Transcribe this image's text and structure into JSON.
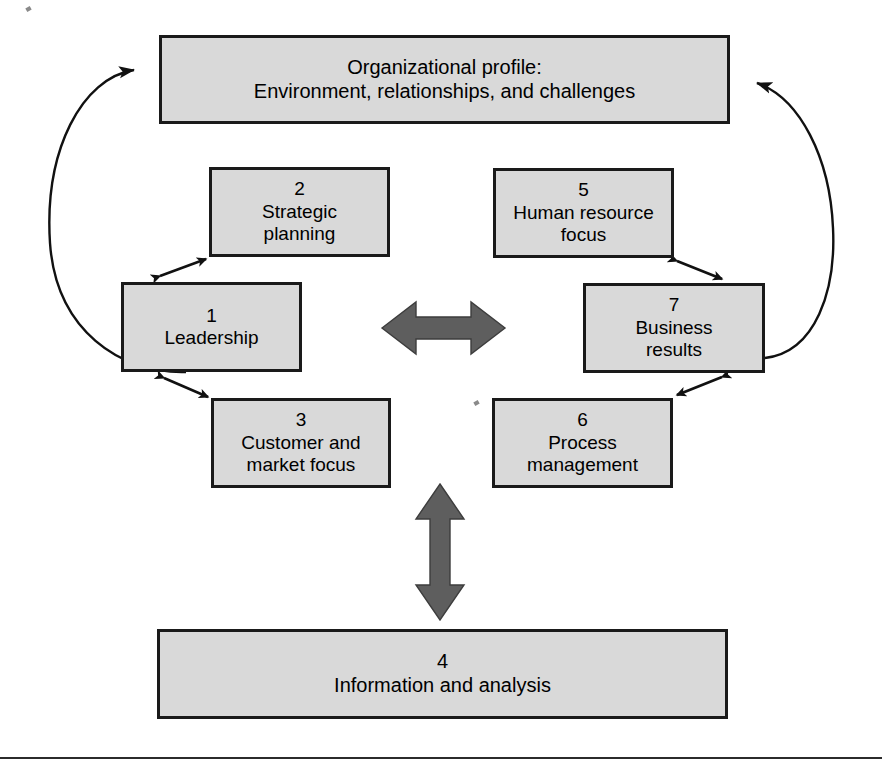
{
  "diagram": {
    "type": "systems-framework",
    "colors": {
      "node_fill": "#d9d9d9",
      "node_border": "#1a1a1a",
      "arrow_fill": "#595959",
      "thin_arrow": "#111111",
      "background": "#ffffff"
    },
    "nodes": [
      {
        "id": "profile",
        "number": "",
        "label": "Organizational profile:\nEnvironment, relationships, and challenges"
      },
      {
        "id": "strategic",
        "number": "2",
        "label": "Strategic\nplanning"
      },
      {
        "id": "hr",
        "number": "5",
        "label": "Human resource\nfocus"
      },
      {
        "id": "leadership",
        "number": "1",
        "label": "Leadership"
      },
      {
        "id": "results",
        "number": "7",
        "label": "Business\nresults"
      },
      {
        "id": "customer",
        "number": "3",
        "label": "Customer and\nmarket focus"
      },
      {
        "id": "process",
        "number": "6",
        "label": "Process\nmanagement"
      },
      {
        "id": "information",
        "number": "4",
        "label": "Information and analysis"
      }
    ],
    "connectors": [
      {
        "id": "curve-left",
        "from": "leadership",
        "to": "profile",
        "style": "curved-arc",
        "heads": "one"
      },
      {
        "id": "curve-right",
        "from": "results",
        "to": "profile",
        "style": "curved-arc",
        "heads": "one"
      },
      {
        "id": "leadership-strategic",
        "from": "leadership",
        "to": "strategic",
        "style": "thin-double",
        "heads": "both"
      },
      {
        "id": "leadership-customer",
        "from": "leadership",
        "to": "customer",
        "style": "thin-double",
        "heads": "both"
      },
      {
        "id": "results-hr",
        "from": "results",
        "to": "hr",
        "style": "thin-double",
        "heads": "both"
      },
      {
        "id": "results-process",
        "from": "results",
        "to": "process",
        "style": "thin-double",
        "heads": "both"
      },
      {
        "id": "center-horizontal",
        "from": "leadership",
        "to": "results",
        "style": "block-double",
        "heads": "both"
      },
      {
        "id": "center-vertical",
        "from": "core",
        "to": "information",
        "style": "block-double",
        "heads": "both"
      }
    ]
  }
}
